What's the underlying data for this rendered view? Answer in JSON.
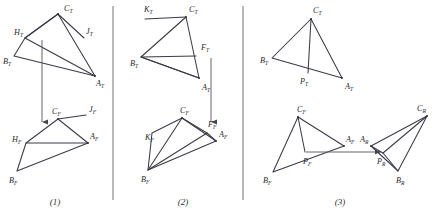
{
  "figure": {
    "stroke_color": "#3a3a46",
    "divider_color": "#70707a",
    "background": "#ffffff",
    "panel_numbers": [
      "(1)",
      "(2)",
      "(3)"
    ]
  },
  "panels": [
    {
      "id": "panel-1",
      "number": "(1)",
      "views": [
        {
          "id": "panel-1-top-view",
          "view": "T",
          "labels": [
            {
              "name": "C_T",
              "base": "C",
              "sub": "T",
              "x": 64,
              "y": 11
            },
            {
              "name": "H_T",
              "base": "H",
              "sub": "T",
              "x": 17,
              "y": 35
            },
            {
              "name": "J_T",
              "base": "J",
              "sub": "T",
              "x": 87,
              "y": 34
            },
            {
              "name": "B_T",
              "base": "B",
              "sub": "T",
              "x": 5,
              "y": 62
            },
            {
              "name": "A_T",
              "base": "A",
              "sub": "T",
              "x": 97,
              "y": 83
            }
          ],
          "vertices": {
            "C": [
              58,
              14
            ],
            "H": [
              25,
              38
            ],
            "J": [
              84,
              38
            ],
            "B": [
              14,
              56
            ],
            "A": [
              95,
              76
            ]
          }
        },
        {
          "id": "panel-1-front-view",
          "view": "F",
          "labels": [
            {
              "name": "C_F",
              "base": "C",
              "sub": "F",
              "x": 53,
              "y": 112
            },
            {
              "name": "J_F",
              "base": "J",
              "sub": "F",
              "x": 88,
              "y": 110
            },
            {
              "name": "H_F",
              "base": "H",
              "sub": "F",
              "x": 14,
              "y": 141
            },
            {
              "name": "A_F",
              "base": "A",
              "sub": "F",
              "x": 92,
              "y": 136
            },
            {
              "name": "B_F",
              "base": "B",
              "sub": "F",
              "x": 10,
              "y": 180
            }
          ],
          "vertices": {
            "C": [
              58,
              119
            ],
            "J": [
              86,
              115
            ],
            "H": [
              26,
              143
            ],
            "A": [
              88,
              143
            ],
            "B": [
              17,
              171
            ]
          }
        }
      ]
    },
    {
      "id": "panel-2",
      "number": "(2)",
      "views": [
        {
          "id": "panel-2-top-view",
          "view": "T",
          "labels": [
            {
              "name": "K_T",
              "base": "K",
              "sub": "T",
              "x": 146,
              "y": 11
            },
            {
              "name": "C_T",
              "base": "C",
              "sub": "T",
              "x": 189,
              "y": 11
            },
            {
              "name": "F_T",
              "base": "F",
              "sub": "T",
              "x": 201,
              "y": 50
            },
            {
              "name": "B_T",
              "base": "B",
              "sub": "T",
              "x": 132,
              "y": 64
            },
            {
              "name": "A_T",
              "base": "A",
              "sub": "T",
              "x": 203,
              "y": 87
            }
          ],
          "vertices": {
            "K": [
              145,
              19
            ],
            "C": [
              186,
              17
            ],
            "F": [
              196,
              56
            ],
            "B": [
              141,
              57
            ],
            "A": [
              199,
              78
            ]
          }
        },
        {
          "id": "panel-2-front-view",
          "view": "F",
          "labels": [
            {
              "name": "C_F",
              "base": "C",
              "sub": "F",
              "x": 181,
              "y": 111
            },
            {
              "name": "F_F",
              "base": "F",
              "sub": "F",
              "x": 207,
              "y": 125
            },
            {
              "name": "K_F",
              "base": "K",
              "sub": "F",
              "x": 147,
              "y": 138
            },
            {
              "name": "A_F",
              "base": "A",
              "sub": "F",
              "x": 219,
              "y": 134
            },
            {
              "name": "B_F",
              "base": "B",
              "sub": "F",
              "x": 143,
              "y": 180
            }
          ],
          "vertices": {
            "C": [
              182,
              118
            ],
            "F": [
              207,
              133
            ],
            "K": [
              152,
              133
            ],
            "A": [
              216,
              141
            ],
            "B": [
              148,
              170
            ]
          }
        }
      ]
    },
    {
      "id": "panel-3",
      "number": "(3)",
      "views": [
        {
          "id": "panel-3-top-view",
          "view": "T",
          "labels": [
            {
              "name": "C_T",
              "base": "C",
              "sub": "T",
              "x": 316,
              "y": 12
            },
            {
              "name": "B_T",
              "base": "B",
              "sub": "T",
              "x": 262,
              "y": 64
            },
            {
              "name": "P_T",
              "base": "P",
              "sub": "T",
              "x": 301,
              "y": 81
            },
            {
              "name": "A_T",
              "base": "A",
              "sub": "T",
              "x": 348,
              "y": 86
            }
          ],
          "vertices": {
            "C": [
              311,
              19
            ],
            "B": [
              272,
              58
            ],
            "P": [
              308,
              73
            ],
            "A": [
              342,
              78
            ]
          }
        },
        {
          "id": "panel-3-front-view",
          "view": "F",
          "labels": [
            {
              "name": "C_F",
              "base": "C",
              "sub": "F",
              "x": 300,
              "y": 110
            },
            {
              "name": "A_F",
              "base": "A",
              "sub": "F",
              "x": 348,
              "y": 139
            },
            {
              "name": "P_F",
              "base": "P",
              "sub": "F",
              "x": 308,
              "y": 160
            },
            {
              "name": "B_F",
              "base": "B",
              "sub": "F",
              "x": 266,
              "y": 181
            }
          ],
          "vertices": {
            "C": [
              298,
              117
            ],
            "A": [
              344,
              146
            ],
            "P": [
              305,
              152
            ],
            "B": [
              273,
              172
            ]
          }
        },
        {
          "id": "panel-3-auxiliary-view",
          "view": "R",
          "labels": [
            {
              "name": "C_R",
              "base": "C",
              "sub": "R",
              "x": 419,
              "y": 109
            },
            {
              "name": "A_R",
              "base": "A",
              "sub": "R",
              "x": 362,
              "y": 139
            },
            {
              "name": "P_R",
              "base": "P",
              "sub": "R",
              "x": 379,
              "y": 160
            },
            {
              "name": "B_R",
              "base": "B",
              "sub": "R",
              "x": 399,
              "y": 180
            }
          ],
          "vertices": {
            "C": [
              427,
              116
            ],
            "A": [
              371,
              146
            ],
            "P": [
              383,
              153
            ],
            "B": [
              398,
              171
            ]
          }
        }
      ]
    }
  ],
  "dividers": [
    {
      "name": "divider-1",
      "x": 113,
      "y1": 6,
      "y2": 200
    },
    {
      "name": "divider-2",
      "x": 243,
      "y1": 6,
      "y2": 200
    }
  ],
  "projection_lines": [
    {
      "name": "projector-panel-1",
      "x1": 42,
      "y1": 40,
      "x2": 42,
      "y2": 122,
      "arrow": "down"
    },
    {
      "name": "projector-panel-2",
      "x1": 211,
      "y1": 58,
      "x2": 211,
      "y2": 122,
      "arrow": "down"
    },
    {
      "name": "transfer-panel-3",
      "x1": 306,
      "y1": 152,
      "x2": 381,
      "y2": 152,
      "arrow": "right"
    }
  ]
}
